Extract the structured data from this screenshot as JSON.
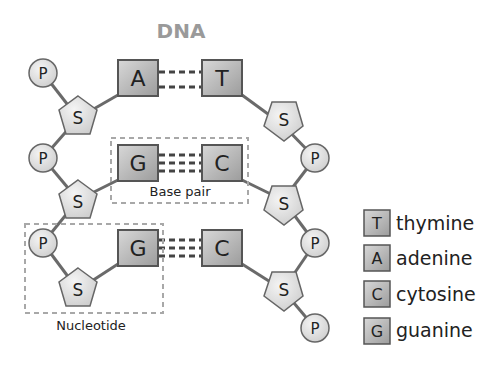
{
  "title": "DNA",
  "labels": {
    "base_pair": "Base pair",
    "nucleotide": "Nucleotide"
  },
  "symbols": {
    "phosphate": "P",
    "sugar": "S"
  },
  "pairs": [
    {
      "left": "A",
      "right": "T",
      "bonds": 2
    },
    {
      "left": "G",
      "right": "C",
      "bonds": 3
    },
    {
      "left": "G",
      "right": "C",
      "bonds": 3
    }
  ],
  "legend": [
    {
      "letter": "T",
      "name": "thymine"
    },
    {
      "letter": "A",
      "name": "adenine"
    },
    {
      "letter": "C",
      "name": "cytosine"
    },
    {
      "letter": "G",
      "name": "guanine"
    }
  ],
  "colors": {
    "title": "#9a9a9a",
    "stroke": "#555555",
    "box_fill_light": "#d6d6d6",
    "box_fill_dark": "#9a9a9a",
    "node_fill": "#e6e6e6",
    "dash_box": "#a8a8a8"
  }
}
